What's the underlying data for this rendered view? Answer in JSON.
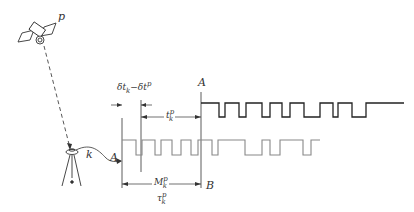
{
  "diagram": {
    "type": "GNSS pseudorange signal timing diagram",
    "labels": {
      "satellite": "p",
      "receiver": "k",
      "left_A": "A",
      "right_A": "A",
      "point_B": "B",
      "clock_offset": "δt_k−δt^p",
      "clock_offset_main": "δt",
      "clock_offset_sub1": "k",
      "clock_offset_mid": "−δt",
      "clock_offset_sup": "p",
      "travel_time_main": "t",
      "travel_time_sub": "k",
      "travel_time_sup": "p",
      "code_shift_main": "M",
      "code_shift_sub": "k",
      "code_shift_sup": "p",
      "tau_main": "τ",
      "tau_sub": "k",
      "tau_sup": "p"
    },
    "colors": {
      "line": "#333333",
      "satellite_signal": "#222222",
      "replica_signal": "#888888",
      "dashed": "#444444"
    }
  }
}
